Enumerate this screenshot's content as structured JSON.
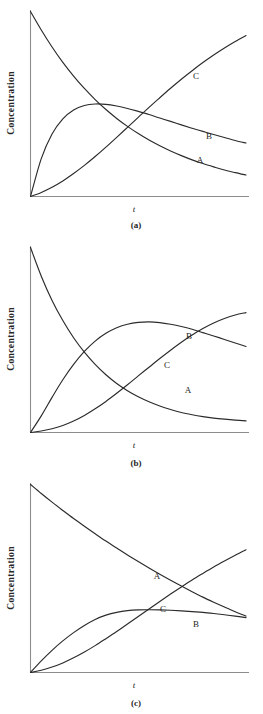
{
  "figure": {
    "background_color": "#ffffff",
    "curve_color": "#2b2b2b",
    "axis_color": "#8c8c8c",
    "ylabel": "Concentration",
    "xlabel": "t",
    "panels": [
      {
        "id": "a",
        "caption": "(a)",
        "curve_labels": {
          "A": "A",
          "B": "B",
          "C": "C"
        }
      },
      {
        "id": "b",
        "caption": "(b)",
        "curve_labels": {
          "A": "A",
          "B": "B",
          "C": "C"
        }
      },
      {
        "id": "c",
        "caption": "(c)",
        "curve_labels": {
          "A": "A",
          "B": "B",
          "C": "C"
        }
      }
    ]
  },
  "chart_data": [
    {
      "type": "line",
      "panel": "a",
      "title": "(a)",
      "xlabel": "t",
      "ylabel": "Concentration",
      "grid": false,
      "legend": "inline-curve-labels",
      "xlim": [
        0,
        1
      ],
      "ylim": [
        0,
        1
      ],
      "x": [
        0,
        0.05,
        0.1,
        0.15,
        0.2,
        0.25,
        0.3,
        0.35,
        0.4,
        0.45,
        0.5,
        0.55,
        0.6,
        0.65,
        0.7,
        0.75,
        0.8,
        0.85,
        0.9,
        0.95,
        1
      ],
      "series": [
        {
          "name": "A",
          "label": "A",
          "description": "reactant, monotonic exponential decay from maximum to near zero",
          "values": [
            1.0,
            0.9,
            0.808,
            0.725,
            0.651,
            0.584,
            0.524,
            0.47,
            0.422,
            0.379,
            0.34,
            0.305,
            0.274,
            0.246,
            0.221,
            0.198,
            0.178,
            0.16,
            0.143,
            0.129,
            0.116
          ]
        },
        {
          "name": "B",
          "label": "B",
          "description": "intermediate, rises fast to a maximum near t=0.3 then decays slowly",
          "values": [
            0.0,
            0.205,
            0.338,
            0.42,
            0.468,
            0.492,
            0.5,
            0.498,
            0.489,
            0.476,
            0.46,
            0.443,
            0.424,
            0.406,
            0.387,
            0.369,
            0.352,
            0.335,
            0.319,
            0.303,
            0.289
          ]
        },
        {
          "name": "C",
          "label": "C",
          "description": "product, sigmoidal rise with slight induction then steady growth",
          "values": [
            0.0,
            0.022,
            0.05,
            0.084,
            0.124,
            0.168,
            0.216,
            0.267,
            0.32,
            0.374,
            0.428,
            0.482,
            0.534,
            0.585,
            0.634,
            0.68,
            0.724,
            0.765,
            0.803,
            0.838,
            0.87
          ]
        }
      ]
    },
    {
      "type": "line",
      "panel": "b",
      "title": "(b)",
      "xlabel": "t",
      "ylabel": "Concentration",
      "grid": false,
      "legend": "inline-curve-labels",
      "xlim": [
        0,
        1
      ],
      "ylim": [
        0,
        1
      ],
      "x": [
        0,
        0.05,
        0.1,
        0.15,
        0.2,
        0.25,
        0.3,
        0.35,
        0.4,
        0.45,
        0.5,
        0.55,
        0.6,
        0.65,
        0.7,
        0.75,
        0.8,
        0.85,
        0.9,
        0.95,
        1
      ],
      "series": [
        {
          "name": "A",
          "label": "A",
          "description": "reactant, steep exponential decay approaching a small residual value",
          "values": [
            1.0,
            0.845,
            0.714,
            0.605,
            0.512,
            0.434,
            0.368,
            0.312,
            0.265,
            0.226,
            0.193,
            0.166,
            0.143,
            0.124,
            0.108,
            0.096,
            0.086,
            0.078,
            0.072,
            0.067,
            0.063
          ]
        },
        {
          "name": "B",
          "label": "B",
          "description": "intermediate, rises to a broad flat maximum near t=0.55 then declines gently",
          "values": [
            0.0,
            0.09,
            0.19,
            0.285,
            0.368,
            0.438,
            0.494,
            0.536,
            0.566,
            0.585,
            0.595,
            0.598,
            0.594,
            0.585,
            0.573,
            0.558,
            0.54,
            0.522,
            0.503,
            0.484,
            0.465
          ]
        },
        {
          "name": "C",
          "label": "C",
          "description": "product, slow induction then near-linear rise crossing B near t=0.9",
          "values": [
            0.0,
            0.008,
            0.02,
            0.038,
            0.062,
            0.092,
            0.128,
            0.168,
            0.212,
            0.258,
            0.306,
            0.353,
            0.4,
            0.445,
            0.488,
            0.527,
            0.562,
            0.592,
            0.616,
            0.635,
            0.648
          ]
        }
      ]
    },
    {
      "type": "line",
      "panel": "c",
      "title": "(c)",
      "xlabel": "t",
      "ylabel": "Concentration",
      "grid": false,
      "legend": "inline-curve-labels",
      "xlim": [
        0,
        1
      ],
      "ylim": [
        0,
        1
      ],
      "x": [
        0,
        0.05,
        0.1,
        0.15,
        0.2,
        0.25,
        0.3,
        0.35,
        0.4,
        0.45,
        0.5,
        0.55,
        0.6,
        0.65,
        0.7,
        0.75,
        0.8,
        0.85,
        0.9,
        0.95,
        1
      ],
      "series": [
        {
          "name": "A",
          "label": "A",
          "description": "reactant, gentle exponential decay remaining well above zero at the end",
          "values": [
            1.0,
            0.952,
            0.906,
            0.862,
            0.819,
            0.778,
            0.738,
            0.699,
            0.662,
            0.625,
            0.59,
            0.556,
            0.523,
            0.491,
            0.46,
            0.43,
            0.401,
            0.374,
            0.348,
            0.323,
            0.3
          ]
        },
        {
          "name": "B",
          "label": "B",
          "description": "intermediate, rises to a low broad plateau around 0.33 then decays very slowly",
          "values": [
            0.0,
            0.062,
            0.118,
            0.168,
            0.212,
            0.25,
            0.282,
            0.305,
            0.32,
            0.329,
            0.333,
            0.334,
            0.333,
            0.331,
            0.328,
            0.324,
            0.32,
            0.314,
            0.307,
            0.3,
            0.292
          ]
        },
        {
          "name": "C",
          "label": "C",
          "description": "product, near-linear rise crossing B near t=0.5 and crossing A near t=0.8",
          "values": [
            0.0,
            0.012,
            0.029,
            0.051,
            0.078,
            0.109,
            0.143,
            0.18,
            0.218,
            0.258,
            0.298,
            0.338,
            0.378,
            0.417,
            0.455,
            0.492,
            0.527,
            0.561,
            0.593,
            0.624,
            0.653
          ]
        }
      ]
    }
  ]
}
